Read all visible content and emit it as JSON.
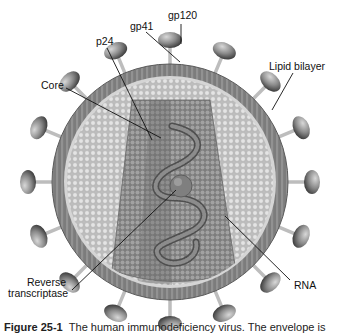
{
  "diagram": {
    "labels": {
      "gp120": "gp120",
      "gp41": "gp41",
      "p24": "p24",
      "lipid_bilayer": "Lipid bilayer",
      "core": "Core",
      "reverse_transcriptase_line1": "Reverse",
      "reverse_transcriptase_line2": "transcriptase",
      "rna": "RNA"
    },
    "caption": {
      "figure_number": "Figure 25-1",
      "text": "The human immunodeficiency virus. The envelope is"
    },
    "colors": {
      "background": "#ffffff",
      "membrane": "#7a7a7a",
      "membrane_dark": "#5e5e5e",
      "matrix": "#c9c9c9",
      "matrix_dot": "#e2e2e2",
      "capsid": "#8c8c8c",
      "capsid_dark": "#6f6f6f",
      "rna": "#5a5a5a",
      "spike_light": "#b4b4b4",
      "spike_dark": "#3f3f3f",
      "leader_line": "#111111"
    }
  }
}
